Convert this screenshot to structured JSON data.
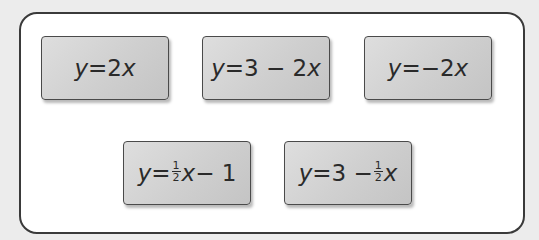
{
  "cards": [
    {
      "id": "card-1",
      "parts": {
        "lhs": "y",
        "eq": "=",
        "rhs_a": "2",
        "var": "x"
      },
      "label": "y = 2x"
    },
    {
      "id": "card-2",
      "parts": {
        "lhs": "y",
        "eq": "=",
        "rhs_a": "3 − 2",
        "var": "x"
      },
      "label": "y = 3 − 2x"
    },
    {
      "id": "card-3",
      "parts": {
        "lhs": "y",
        "eq": "=",
        "rhs_a": "−2",
        "var": "x"
      },
      "label": "y = −2x"
    },
    {
      "id": "card-4",
      "parts": {
        "lhs": "y",
        "eq": "=",
        "num": "1",
        "den": "2",
        "var": "x",
        "tail": "− 1"
      },
      "label": "y = ½x − 1"
    },
    {
      "id": "card-5",
      "parts": {
        "lhs": "y",
        "eq": "=",
        "head": "3 −",
        "num": "1",
        "den": "2",
        "var": "x"
      },
      "label": "y = 3 − ½x"
    }
  ],
  "colors": {
    "background": "#ececec",
    "frame_fill": "#ffffff",
    "frame_border": "#3a3a3a",
    "card_fill": "#d2d2d2",
    "card_border": "#4a4a4a",
    "text": "#2a2a2a"
  }
}
